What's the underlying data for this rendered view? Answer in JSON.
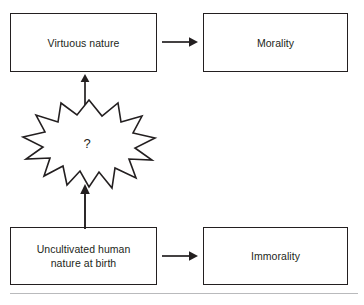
{
  "diagram": {
    "nodes": {
      "virtuous_nature": {
        "label": "Virtuous nature",
        "shape": "rectangle"
      },
      "morality": {
        "label": "Morality",
        "shape": "rectangle"
      },
      "uncultivated_nature": {
        "label": "Uncultivated human\nnature at birth",
        "shape": "rectangle"
      },
      "immorality": {
        "label": "Immorality",
        "shape": "rectangle"
      },
      "unknown_process": {
        "label": "?",
        "shape": "starburst"
      }
    },
    "edges": [
      {
        "id": "virtuous-to-morality",
        "from": "virtuous_nature",
        "to": "morality",
        "direction": "right",
        "icon": "arrow-right-icon"
      },
      {
        "id": "uncultivated-to-immorality",
        "from": "uncultivated_nature",
        "to": "immorality",
        "direction": "right",
        "icon": "arrow-right-icon"
      },
      {
        "id": "burst-to-virtuous",
        "from": "unknown_process",
        "to": "virtuous_nature",
        "direction": "up",
        "icon": "arrow-up-icon"
      },
      {
        "id": "uncultivated-to-burst",
        "from": "uncultivated_nature",
        "to": "unknown_process",
        "direction": "up",
        "icon": "arrow-up-icon"
      }
    ],
    "colors": {
      "stroke": "#231f20",
      "background": "#ffffff",
      "rule": "#b9babc"
    }
  }
}
